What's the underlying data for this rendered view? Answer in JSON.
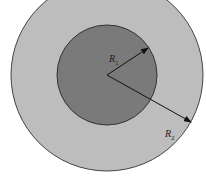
{
  "diagram": {
    "type": "concentric-circles",
    "outer_circle": {
      "cx": 107,
      "cy": 75,
      "r": 96,
      "fill": "#bdbdbd",
      "stroke": "#444444"
    },
    "inner_circle": {
      "cx": 107,
      "cy": 75,
      "r": 50,
      "fill": "#7a7a7a",
      "stroke": "#333333"
    },
    "labels": {
      "r1": {
        "main": "R",
        "sub": "1"
      },
      "r2": {
        "main": "R",
        "sub": "2"
      }
    }
  }
}
